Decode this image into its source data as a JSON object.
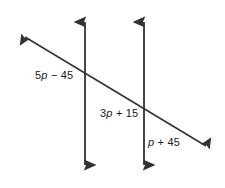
{
  "figure": {
    "background_color": "#ffffff",
    "stroke_color": "#333333",
    "text_color": "#222222",
    "width": 225,
    "height": 188
  },
  "labels": {
    "left": {
      "full": "5p − 45",
      "coefficient": "5",
      "variable": "p",
      "operator": "−",
      "constant": "45"
    },
    "middle": {
      "full": "3p + 15",
      "coefficient": "3",
      "variable": "p",
      "operator": "+",
      "constant": "15"
    },
    "right": {
      "full": "p + 45",
      "coefficient": "",
      "variable": "p",
      "operator": "+",
      "constant": "45"
    }
  },
  "lines": {
    "vertical_left": {
      "x": 85,
      "y_top": 15,
      "y_bottom": 172
    },
    "vertical_right": {
      "x": 144,
      "y_top": 15,
      "y_bottom": 172
    },
    "transversal": {
      "x1": 18,
      "y1": 33,
      "x2": 213,
      "y2": 150
    }
  },
  "intersections": [
    {
      "x": 85,
      "y": 74
    },
    {
      "x": 144,
      "y": 110
    }
  ]
}
